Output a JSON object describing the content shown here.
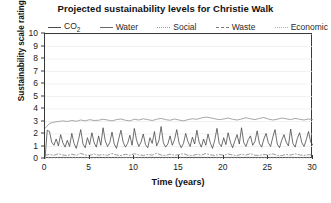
{
  "chart_data": {
    "type": "line",
    "title": "Projected sustainability levels for Christie Walk",
    "xlabel": "Time (years)",
    "ylabel": "Sustainability scale ratings",
    "xlim": [
      0,
      30
    ],
    "ylim": [
      0,
      10
    ],
    "xticks": [
      "0",
      "5",
      "10",
      "15",
      "20",
      "25",
      "30"
    ],
    "yticks": [
      "0",
      "1",
      "2",
      "3",
      "4",
      "5",
      "6",
      "7",
      "8",
      "9",
      "10"
    ],
    "grid": true,
    "legend_position": "above-plot",
    "legend": [
      "CO2",
      "Water",
      "Social",
      "Waste",
      "Economic"
    ],
    "series": [
      {
        "name": "CO2",
        "style": "solid",
        "color": "#404040",
        "x": [
          0,
          0.25,
          0.5,
          0.75,
          1,
          1.25,
          1.5,
          1.75,
          2,
          2.25,
          2.5,
          2.75,
          3,
          3.25,
          3.5,
          3.75,
          4,
          4.25,
          4.5,
          4.75,
          5,
          5.25,
          5.5,
          5.75,
          6,
          6.25,
          6.5,
          6.75,
          7,
          7.25,
          7.5,
          7.75,
          8,
          8.25,
          8.5,
          8.75,
          9,
          9.25,
          9.5,
          9.75,
          10,
          10.25,
          10.5,
          10.75,
          11,
          11.25,
          11.5,
          11.75,
          12,
          12.25,
          12.5,
          12.75,
          13,
          13.25,
          13.5,
          13.75,
          14,
          14.25,
          14.5,
          14.75,
          15,
          15.25,
          15.5,
          15.75,
          16,
          16.25,
          16.5,
          16.75,
          17,
          17.25,
          17.5,
          17.75,
          18,
          18.25,
          18.5,
          18.75,
          19,
          19.25,
          19.5,
          19.75,
          20,
          20.25,
          20.5,
          20.75,
          21,
          21.25,
          21.5,
          21.75,
          22,
          22.25,
          22.5,
          22.75,
          23,
          23.25,
          23.5,
          23.75,
          24,
          24.25,
          24.5,
          24.75,
          25,
          25.25,
          25.5,
          25.75,
          26,
          26.25,
          26.5,
          26.75,
          27,
          27.25,
          27.5,
          27.75,
          28,
          28.25,
          28.5,
          28.75,
          29,
          29.25,
          29.5,
          29.75,
          30
        ],
        "values": [
          0.0,
          2.3,
          2.2,
          1.35,
          1.1,
          1.6,
          1.05,
          1.95,
          1.3,
          0.95,
          1.5,
          1.0,
          2.05,
          1.25,
          0.85,
          1.55,
          2.35,
          1.2,
          0.9,
          1.7,
          1.15,
          2.1,
          1.3,
          0.95,
          1.85,
          1.1,
          2.5,
          1.45,
          1.0,
          1.3,
          2.15,
          1.2,
          0.85,
          1.6,
          2.3,
          1.35,
          0.95,
          1.25,
          1.9,
          1.1,
          2.45,
          1.5,
          1.0,
          1.35,
          2.0,
          1.15,
          0.9,
          1.7,
          1.25,
          2.2,
          1.05,
          1.45,
          2.6,
          1.3,
          0.95,
          1.2,
          1.85,
          1.1,
          1.55,
          2.35,
          1.3,
          0.9,
          1.25,
          2.05,
          1.4,
          1.0,
          1.75,
          1.2,
          2.3,
          1.35,
          0.95,
          1.6,
          1.1,
          2.0,
          1.3,
          0.85,
          1.5,
          2.45,
          1.25,
          1.0,
          1.7,
          1.15,
          2.1,
          1.35,
          0.9,
          1.45,
          1.95,
          1.2,
          2.5,
          1.3,
          1.0,
          1.55,
          1.85,
          1.1,
          1.4,
          2.25,
          1.25,
          0.95,
          1.6,
          2.05,
          1.3,
          1.0,
          1.75,
          2.35,
          1.2,
          0.9,
          1.5,
          1.95,
          1.35,
          1.05,
          2.4,
          1.25,
          0.95,
          1.65,
          2.1,
          1.3,
          1.0,
          1.55,
          2.2,
          1.35,
          1.1
        ]
      },
      {
        "name": "Water",
        "style": "solid",
        "color": "#8a8a8a",
        "x": [
          0,
          0.5,
          1,
          1.5,
          2,
          2.5,
          3,
          3.5,
          4,
          4.5,
          5,
          5.5,
          6,
          6.5,
          7,
          7.5,
          8,
          8.5,
          9,
          9.5,
          10,
          10.5,
          11,
          11.5,
          12,
          12.5,
          13,
          13.5,
          14,
          14.5,
          15,
          15.5,
          16,
          16.5,
          17,
          17.5,
          18,
          18.5,
          19,
          19.5,
          20,
          20.5,
          21,
          21.5,
          22,
          22.5,
          23,
          23.5,
          24,
          24.5,
          25,
          25.5,
          26,
          26.5,
          27,
          27.5,
          28,
          28.5,
          29,
          29.5,
          30
        ],
        "values": [
          2.45,
          2.85,
          2.95,
          3.0,
          3.05,
          3.0,
          3.08,
          3.02,
          3.12,
          3.05,
          3.15,
          3.08,
          3.1,
          3.18,
          3.12,
          3.05,
          3.15,
          3.2,
          3.1,
          3.05,
          3.18,
          3.12,
          3.22,
          3.15,
          3.08,
          3.18,
          3.25,
          3.15,
          3.1,
          3.2,
          3.12,
          3.05,
          3.15,
          3.22,
          3.18,
          3.28,
          3.35,
          3.3,
          3.22,
          3.15,
          3.2,
          3.28,
          3.18,
          3.12,
          3.2,
          3.3,
          3.22,
          3.15,
          3.25,
          3.32,
          3.2,
          3.12,
          3.18,
          3.28,
          3.22,
          3.15,
          3.25,
          3.18,
          3.12,
          3.2,
          3.15
        ]
      },
      {
        "name": "Social",
        "style": "dotted",
        "color": "#b5b5b5",
        "x": [
          0,
          2,
          4,
          6,
          8,
          10,
          12,
          14,
          16,
          18,
          20,
          22,
          24,
          26,
          28,
          30
        ],
        "values": [
          0.12,
          0.14,
          0.13,
          0.15,
          0.14,
          0.13,
          0.15,
          0.14,
          0.16,
          0.15,
          0.14,
          0.15,
          0.14,
          0.15,
          0.14,
          0.15
        ]
      },
      {
        "name": "Waste",
        "style": "dashdot",
        "color": "#6e6e6e",
        "x": [
          0,
          0.5,
          1,
          1.5,
          2,
          2.5,
          3,
          3.5,
          4,
          4.5,
          5,
          5.5,
          6,
          6.5,
          7,
          7.5,
          8,
          8.5,
          9,
          9.5,
          10,
          10.5,
          11,
          11.5,
          12,
          12.5,
          13,
          13.5,
          14,
          14.5,
          15,
          15.5,
          16,
          16.5,
          17,
          17.5,
          18,
          18.5,
          19,
          19.5,
          20,
          20.5,
          21,
          21.5,
          22,
          22.5,
          23,
          23.5,
          24,
          24.5,
          25,
          25.5,
          26,
          26.5,
          27,
          27.5,
          28,
          28.5,
          29,
          29.5,
          30
        ],
        "values": [
          0.3,
          0.36,
          0.3,
          0.42,
          0.32,
          0.28,
          0.38,
          0.3,
          0.45,
          0.33,
          0.29,
          0.4,
          0.31,
          0.35,
          0.3,
          0.44,
          0.32,
          0.28,
          0.38,
          0.3,
          0.42,
          0.33,
          0.29,
          0.36,
          0.31,
          0.46,
          0.32,
          0.28,
          0.39,
          0.3,
          0.35,
          0.42,
          0.3,
          0.28,
          0.37,
          0.31,
          0.44,
          0.33,
          0.29,
          0.36,
          0.3,
          0.4,
          0.32,
          0.28,
          0.38,
          0.31,
          0.43,
          0.3,
          0.29,
          0.36,
          0.32,
          0.41,
          0.3,
          0.28,
          0.37,
          0.31,
          0.42,
          0.33,
          0.29,
          0.35,
          0.31
        ]
      },
      {
        "name": "Economic",
        "style": "dots",
        "color": "#c4c4c4",
        "x": [
          0,
          3,
          6,
          9,
          12,
          15,
          18,
          21,
          24,
          27,
          30
        ],
        "values": [
          0.06,
          0.07,
          0.06,
          0.07,
          0.06,
          0.07,
          0.06,
          0.07,
          0.06,
          0.07,
          0.06
        ]
      }
    ]
  },
  "legend": {
    "items": [
      {
        "label": "CO",
        "sub": "2",
        "style": "sw-solid"
      },
      {
        "label": "Water",
        "sub": "",
        "style": "sw-solid2"
      },
      {
        "label": "Social",
        "sub": "",
        "style": "sw-dotted"
      },
      {
        "label": "Waste",
        "sub": "",
        "style": "sw-dashdot"
      },
      {
        "label": "Economic",
        "sub": "",
        "style": "sw-dots"
      }
    ]
  }
}
